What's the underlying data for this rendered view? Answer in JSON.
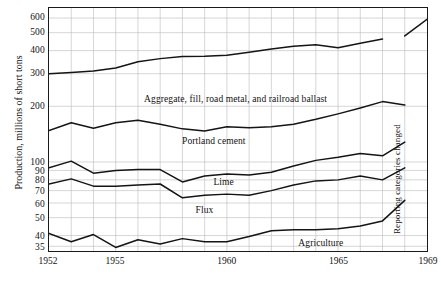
{
  "chart_data": {
    "type": "line",
    "title": "",
    "xlabel": "",
    "ylabel": "Production, millions of short tons",
    "scale": "log",
    "grid": true,
    "legend_position": "inline-annotations",
    "xlim": [
      1952,
      1969
    ],
    "ylim": [
      33,
      680
    ],
    "x": [
      1952,
      1953,
      1954,
      1955,
      1956,
      1957,
      1958,
      1959,
      1960,
      1961,
      1962,
      1963,
      1964,
      1965,
      1966,
      1967,
      1968,
      1969
    ],
    "xticks": [
      "1952",
      "1955",
      "1960",
      "1965",
      "1969"
    ],
    "yticks": [
      "600",
      "500",
      "400",
      "300",
      "200",
      "100",
      "90",
      "80",
      "70",
      "60",
      "50",
      "40",
      "35"
    ],
    "ytick_values": [
      600,
      500,
      400,
      300,
      200,
      100,
      90,
      80,
      70,
      60,
      50,
      40,
      35
    ],
    "annotations": [
      {
        "text": "Aggregate, fill, road metal, and railroad ballast",
        "x": 1956.3,
        "y": 215
      },
      {
        "text": "Portland cement",
        "x": 1958.0,
        "y": 128
      },
      {
        "text": "Lime",
        "x": 1959.4,
        "y": 77.5
      },
      {
        "text": "Flux",
        "x": 1958.6,
        "y": 55
      },
      {
        "text": "Agriculture",
        "x": 1963.2,
        "y": 36.6
      },
      {
        "text": "Reporting categories changed",
        "x": 1967.4,
        "y": 41,
        "rotated": true
      }
    ],
    "series": [
      {
        "name": "Aggregate, fill, road metal, and railroad ballast",
        "values": [
          300,
          305,
          310,
          322,
          348,
          362,
          372,
          373,
          378,
          392,
          408,
          422,
          430,
          415,
          438,
          462,
          480,
          590
        ],
        "break_after_index": 15
      },
      {
        "name": "Portland cement",
        "values": [
          148,
          163,
          152,
          163,
          168,
          160,
          151,
          147,
          155,
          153,
          155,
          160,
          170,
          182,
          196,
          212,
          203,
          206
        ],
        "break_after_index": 16
      },
      {
        "name": "Lime",
        "values": [
          93,
          101,
          87,
          90,
          91,
          91,
          78,
          84,
          86,
          85,
          88,
          95,
          102,
          106,
          111,
          108,
          128,
          131
        ],
        "break_after_index": 16
      },
      {
        "name": "Flux",
        "values": [
          76,
          81,
          74,
          74,
          75,
          76,
          64,
          66,
          67,
          66,
          70,
          75,
          79,
          80,
          84,
          80,
          93,
          94
        ],
        "break_after_index": 16
      },
      {
        "name": "Agriculture",
        "values": [
          41,
          37,
          40.5,
          34.5,
          38,
          36,
          38.5,
          37,
          37,
          39.5,
          42.5,
          43,
          43,
          43.5,
          45,
          48,
          62,
          62.5
        ],
        "break_after_index": 16
      }
    ]
  },
  "axis": {
    "y_title": "Production, millions of short tons"
  }
}
